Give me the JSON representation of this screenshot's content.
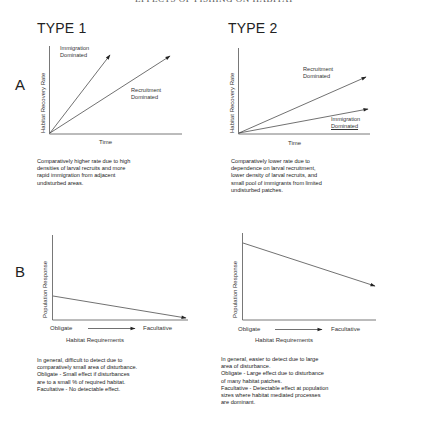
{
  "header": {
    "title": "EFFECTS OF FISHING ON HABITAT"
  },
  "columns": [
    {
      "title": "TYPE 1",
      "panel_a": {
        "y_label": "Habitat Recovery Rate",
        "x_label": "Time",
        "lines": [
          {
            "label_line1": "Immigration",
            "label_line2": "Dominated"
          },
          {
            "label_line1": "Recruitment",
            "label_line2": "Dominated"
          }
        ],
        "description": [
          "Comparatively higher rate due to high",
          "densities of larval recruits and more",
          "rapid immigration from adjacent",
          "undisturbed areas."
        ]
      },
      "panel_b": {
        "y_label": "Population Response",
        "x_left": "Obligate",
        "x_right": "Facultative",
        "x_title": "Habitat Requirements",
        "description": [
          "In general, difficult to detect due to",
          "comparatively small area of disturbance.",
          "Obligate - Small effect if disturbances",
          "are to a small % of required habitat.",
          "Facultative - No detectable effect."
        ]
      }
    },
    {
      "title": "TYPE 2",
      "panel_a": {
        "y_label": "Habitat Recovery Rate",
        "x_label": "Time",
        "lines": [
          {
            "label_line1": "Recruitment",
            "label_line2": "Dominated"
          },
          {
            "label_line1": "Immigration",
            "label_line2": "Dominated"
          }
        ],
        "description": [
          "Comparatively lower rate due to",
          "dependence on larval recruitment,",
          "lower density of larval recruits, and",
          "small pool of immigrants from limited",
          "undisturbed patches."
        ]
      },
      "panel_b": {
        "y_label": "Population Response",
        "x_left": "Obligate",
        "x_right": "Facultative",
        "x_title": "Habitat Requirements",
        "description": [
          "In general, easier to detect due to large",
          "area of disturbance.",
          "Obligate - Large effect due to disturbance",
          "of many habitat patches.",
          "Facultative - Detectable effect at population",
          "sizes where habitat mediated processes",
          "are dominant."
        ]
      }
    }
  ],
  "rows": {
    "a_label": "A",
    "b_label": "B"
  }
}
